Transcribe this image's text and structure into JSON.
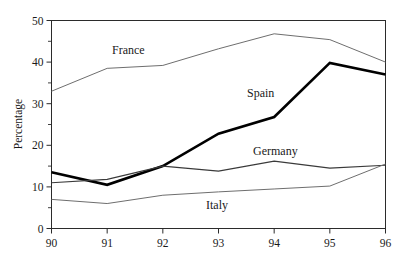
{
  "chart_data": {
    "type": "line",
    "title": "",
    "xlabel": "",
    "ylabel": "Percentage",
    "x": [
      90,
      91,
      92,
      93,
      94,
      95,
      96
    ],
    "xtick_labels": [
      "90",
      "91",
      "92",
      "93",
      "94",
      "95",
      "96"
    ],
    "ytick_labels": [
      "0",
      "10",
      "20",
      "30",
      "40",
      "50"
    ],
    "ytick_values": [
      0,
      10,
      20,
      30,
      40,
      50
    ],
    "yminor_values": [
      5,
      15,
      25,
      35,
      45
    ],
    "xlim": [
      90,
      96
    ],
    "ylim": [
      0,
      50
    ],
    "grid": false,
    "legend_position": "inline-labels",
    "series": [
      {
        "name": "France",
        "values": [
          33.0,
          38.5,
          39.2,
          43.2,
          46.8,
          45.4,
          40.0
        ],
        "style": "thin",
        "color": "#6e6e6e",
        "label_x": 112,
        "label_y": 54
      },
      {
        "name": "Spain",
        "values": [
          13.5,
          10.5,
          15.0,
          22.8,
          26.8,
          39.8,
          37.0
        ],
        "style": "thick",
        "color": "#000000",
        "label_x": 247,
        "label_y": 97
      },
      {
        "name": "Germany",
        "values": [
          11.0,
          11.8,
          15.0,
          13.8,
          16.2,
          14.5,
          15.2
        ],
        "style": "mid",
        "color": "#3a3a3a",
        "label_x": 253,
        "label_y": 155
      },
      {
        "name": "Italy",
        "values": [
          7.0,
          6.0,
          8.0,
          8.8,
          9.5,
          10.2,
          15.5
        ],
        "style": "thin",
        "color": "#8a8a8a",
        "label_x": 206,
        "label_y": 209
      }
    ]
  },
  "figure": {
    "caption": ""
  }
}
